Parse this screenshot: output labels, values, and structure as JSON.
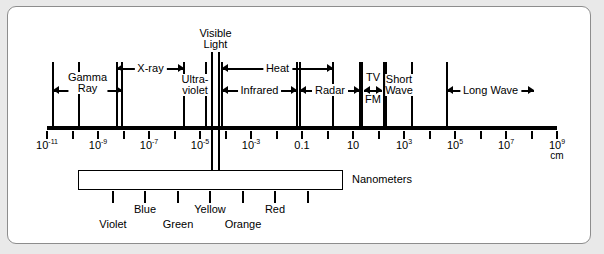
{
  "figure": {
    "axis_unit": "cm",
    "nanometer_label": "Nanometers"
  },
  "axis": {
    "ticks": [
      {
        "exp": -11,
        "label": "10",
        "sup": "-11",
        "show": true
      },
      {
        "exp": -10,
        "label": "",
        "sup": "",
        "show": false
      },
      {
        "exp": -9,
        "label": "10",
        "sup": "-9",
        "show": true
      },
      {
        "exp": -8,
        "label": "",
        "sup": "",
        "show": false
      },
      {
        "exp": -7,
        "label": "10",
        "sup": "-7",
        "show": true
      },
      {
        "exp": -6,
        "label": "",
        "sup": "",
        "show": false
      },
      {
        "exp": -5,
        "label": "10",
        "sup": "-5",
        "show": true
      },
      {
        "exp": -4,
        "label": "",
        "sup": "",
        "show": false
      },
      {
        "exp": -3,
        "label": "10",
        "sup": "-3",
        "show": true
      },
      {
        "exp": -2,
        "label": "",
        "sup": "",
        "show": false
      },
      {
        "exp": -1,
        "label": "0.1",
        "sup": "",
        "show": true
      },
      {
        "exp": 0,
        "label": "",
        "sup": "",
        "show": false
      },
      {
        "exp": 1,
        "label": "10",
        "sup": "",
        "show": true
      },
      {
        "exp": 2,
        "label": "",
        "sup": "",
        "show": false
      },
      {
        "exp": 3,
        "label": "10",
        "sup": "3",
        "show": true
      },
      {
        "exp": 4,
        "label": "",
        "sup": "",
        "show": false
      },
      {
        "exp": 5,
        "label": "10",
        "sup": "5",
        "show": true
      },
      {
        "exp": 6,
        "label": "",
        "sup": "",
        "show": false
      },
      {
        "exp": 7,
        "label": "10",
        "sup": "7",
        "show": true
      },
      {
        "exp": 8,
        "label": "",
        "sup": "",
        "show": false
      },
      {
        "exp": 9,
        "label": "10",
        "sup": "9",
        "show": true
      }
    ],
    "unit": "cm"
  },
  "bands": [
    {
      "name": "Gamma Ray",
      "label": "Gamma\nRay",
      "line1": "Gamma",
      "line2": "Ray",
      "style": "bracket2",
      "x1": 53,
      "x2": 122,
      "row": 2
    },
    {
      "name": "X-ray",
      "label": "X-ray",
      "line1": "X-ray",
      "line2": "",
      "style": "bracket",
      "x1": 117,
      "x2": 184,
      "row": 1
    },
    {
      "name": "Ultraviolet",
      "label": "Ultra-violet",
      "line1": "Ultra-",
      "line2": "violet",
      "style": "stack",
      "x1": 184,
      "x2": 206,
      "row": 2
    },
    {
      "name": "Visible Light",
      "label": "Visible Light",
      "line1": "Visible",
      "line2": "Light",
      "style": "top",
      "x1": 212,
      "x2": 219,
      "row": 0
    },
    {
      "name": "Heat",
      "label": "Heat",
      "line1": "Heat",
      "line2": "",
      "style": "bracket",
      "x1": 222,
      "x2": 333,
      "row": 1
    },
    {
      "name": "Infrared",
      "label": "Infrared",
      "line1": "Infrared",
      "line2": "",
      "style": "bracket",
      "x1": 222,
      "x2": 297,
      "row": 2
    },
    {
      "name": "Radar",
      "label": "Radar",
      "line1": "Radar",
      "line2": "",
      "style": "bracket",
      "x1": 300,
      "x2": 360,
      "row": 2
    },
    {
      "name": "TV FM",
      "label": "TV / FM",
      "line1": "TV",
      "line2": "FM",
      "style": "tvfm",
      "x1": 362,
      "x2": 384,
      "row": 2
    },
    {
      "name": "Short Wave",
      "label": "Short Wave",
      "line1": "Short",
      "line2": "Wave",
      "style": "stack",
      "x1": 386,
      "x2": 412,
      "row": 2
    },
    {
      "name": "Long Wave",
      "label": "Long Wave",
      "line1": "Long Wave",
      "line2": "",
      "style": "bracket",
      "x1": 447,
      "x2": 534,
      "row": 2
    }
  ],
  "dividers": [
    53,
    79,
    117,
    122,
    184,
    206,
    212,
    219,
    222,
    297,
    300,
    333,
    360,
    362,
    384,
    386,
    412,
    447
  ],
  "nanometer_scale": {
    "bar_start": 78,
    "bar_end": 343,
    "ticks": [
      {
        "value": "400",
        "x": 113
      },
      {
        "value": "500",
        "x": 178
      },
      {
        "value": "600",
        "x": 243
      },
      {
        "value": "700",
        "x": 308
      }
    ],
    "colors": [
      {
        "name": "Violet",
        "x": 113,
        "row": 2
      },
      {
        "name": "Blue",
        "x": 145,
        "row": 1
      },
      {
        "name": "Green",
        "x": 178,
        "row": 2
      },
      {
        "name": "Yellow",
        "x": 210,
        "row": 1
      },
      {
        "name": "Orange",
        "x": 243,
        "row": 2
      },
      {
        "name": "Red",
        "x": 275,
        "row": 1
      }
    ],
    "color_ticks": [
      113,
      145,
      178,
      210,
      243,
      275,
      308
    ],
    "unit_label": "Nanometers"
  },
  "colors": {
    "ink": "#000000",
    "page": "#ffffff",
    "margin": "#e9e9e9",
    "border": "#8d8d8d"
  }
}
